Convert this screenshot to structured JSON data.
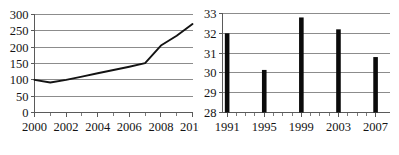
{
  "figure": {
    "title": "",
    "panel_count": 2
  },
  "chart_data": [
    {
      "id": "left-line-chart",
      "type": "line",
      "title": "",
      "xlabel": "",
      "ylabel": "",
      "x": [
        2000,
        2001,
        2002,
        2003,
        2004,
        2005,
        2006,
        2007,
        2008,
        2009,
        2010
      ],
      "values": [
        100,
        92,
        100,
        110,
        120,
        130,
        140,
        151,
        205,
        235,
        271
      ],
      "series": [
        {
          "name": "series-1",
          "color": "#131313",
          "values": [
            100,
            92,
            100,
            110,
            120,
            130,
            140,
            151,
            205,
            235,
            271
          ]
        }
      ],
      "xlim": [
        2000,
        2010
      ],
      "ylim": [
        0,
        300
      ],
      "ytick_values": [
        0,
        50,
        100,
        150,
        200,
        250,
        300
      ],
      "ytick_labels": [
        "0",
        "50",
        "100",
        "150",
        "200",
        "250",
        "300"
      ],
      "xtick_values": [
        2000,
        2001,
        2002,
        2003,
        2004,
        2005,
        2006,
        2007,
        2008,
        2009,
        2010
      ],
      "xtick_labels_shown": [
        "2000",
        "2002",
        "2004",
        "2006",
        "2008",
        "2010"
      ],
      "xtick_labeled_values": [
        2000,
        2002,
        2004,
        2006,
        2008,
        2010
      ],
      "grid": "horizontal",
      "grid_color": "#8c8c8c",
      "legend": "none"
    },
    {
      "id": "right-bar-chart",
      "type": "bar",
      "title": "",
      "xlabel": "",
      "ylabel": "",
      "categories": [
        "1991",
        "1995",
        "1999",
        "2003",
        "2007"
      ],
      "category_values": [
        1991,
        1995,
        1999,
        2003,
        2007
      ],
      "values": [
        32.0,
        30.15,
        32.8,
        32.2,
        30.8
      ],
      "series": [
        {
          "name": "series-1",
          "color": "#0b0b0b",
          "values": [
            32.0,
            30.15,
            32.8,
            32.2,
            30.8
          ]
        }
      ],
      "xlim": [
        1990.5,
        2008.5
      ],
      "ylim": [
        28,
        33
      ],
      "ytick_values": [
        28,
        29,
        30,
        31,
        32,
        33
      ],
      "ytick_labels": [
        "28",
        "29",
        "30",
        "31",
        "32",
        "33"
      ],
      "xtick_values": [
        1991,
        1992,
        1993,
        1994,
        1995,
        1996,
        1997,
        1998,
        1999,
        2000,
        2001,
        2002,
        2003,
        2004,
        2005,
        2006,
        2007
      ],
      "xtick_labels_shown": [
        "1991",
        "1995",
        "1999",
        "2003",
        "2007"
      ],
      "xtick_labeled_values": [
        1991,
        1995,
        1999,
        2003,
        2007
      ],
      "grid": "horizontal",
      "grid_color": "#8c8c8c",
      "legend": "none",
      "bar_baseline": 28
    }
  ]
}
